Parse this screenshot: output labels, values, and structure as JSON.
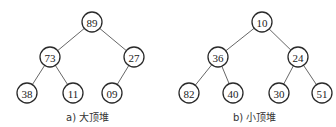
{
  "trees": [
    {
      "caption": "a) 大顶堆",
      "nodes": [
        {
          "id": "n89",
          "value": "89",
          "x": 92,
          "y": 22
        },
        {
          "id": "n73",
          "value": "73",
          "x": 50,
          "y": 57
        },
        {
          "id": "n27",
          "value": "27",
          "x": 134,
          "y": 57
        },
        {
          "id": "n38",
          "value": "38",
          "x": 27,
          "y": 93
        },
        {
          "id": "n11",
          "value": "11",
          "x": 73,
          "y": 93
        },
        {
          "id": "n09",
          "value": "09",
          "x": 112,
          "y": 93
        }
      ],
      "edges": [
        [
          "n89",
          "n73"
        ],
        [
          "n89",
          "n27"
        ],
        [
          "n73",
          "n38"
        ],
        [
          "n73",
          "n11"
        ],
        [
          "n27",
          "n09"
        ]
      ]
    },
    {
      "caption": "b) 小顶堆",
      "nodes": [
        {
          "id": "m10",
          "value": "10",
          "x": 262,
          "y": 22
        },
        {
          "id": "m36",
          "value": "36",
          "x": 218,
          "y": 57
        },
        {
          "id": "m24",
          "value": "24",
          "x": 298,
          "y": 57
        },
        {
          "id": "m82",
          "value": "82",
          "x": 189,
          "y": 93
        },
        {
          "id": "m40",
          "value": "40",
          "x": 233,
          "y": 93
        },
        {
          "id": "m30",
          "value": "30",
          "x": 279,
          "y": 93
        },
        {
          "id": "m51",
          "value": "51",
          "x": 322,
          "y": 93
        }
      ],
      "edges": [
        [
          "m10",
          "m36"
        ],
        [
          "m10",
          "m24"
        ],
        [
          "m36",
          "m82"
        ],
        [
          "m36",
          "m40"
        ],
        [
          "m24",
          "m30"
        ],
        [
          "m24",
          "m51"
        ]
      ]
    }
  ]
}
